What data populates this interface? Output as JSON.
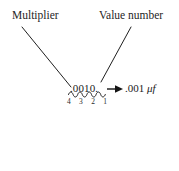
{
  "figure": {
    "title_text": "",
    "background_color": "#ffffff",
    "ink_color": "#1a1a1a",
    "width": 179,
    "height": 171
  },
  "annotations": {
    "multiplier_label": "Multiplier",
    "value_number_label": "Value number"
  },
  "marking": {
    "code_text": ".0010.",
    "digit_positions": [
      "4",
      "3",
      "2",
      "1"
    ]
  },
  "result": {
    "value": ".001",
    "unit": "μf",
    "arrow_icon": "right-arrow-icon"
  },
  "icons": {
    "squiggle": "wavy-underbrace-icon",
    "leader_multiplier": "leader-line-icon",
    "leader_value": "leader-line-icon"
  }
}
